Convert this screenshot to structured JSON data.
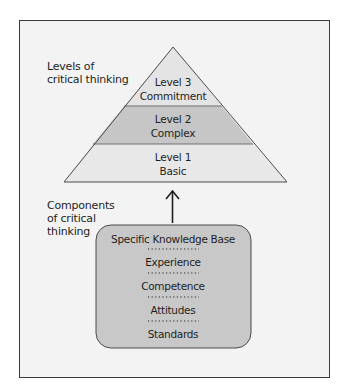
{
  "diagram": {
    "type": "pyramid-with-components",
    "labels": {
      "levels_heading_line1": "Levels of",
      "levels_heading_line2": "critical thinking",
      "components_heading_line1": "Components",
      "components_heading_line2": "of critical",
      "components_heading_line3": "thinking"
    },
    "pyramid": {
      "levels": [
        {
          "line1": "Level 3",
          "line2": "Commitment",
          "color": "#e4e4e4"
        },
        {
          "line1": "Level 2",
          "line2": "Complex",
          "color": "#c6c6c6"
        },
        {
          "line1": "Level 1",
          "line2": "Basic",
          "color": "#e8e8e8"
        }
      ]
    },
    "arrow": {
      "direction": "up",
      "icon": "arrow-up-icon"
    },
    "components_box": {
      "color": "#c8c8c8",
      "items": [
        "Specific Knowledge Base",
        "Experience",
        "Competence",
        "Attitudes",
        "Standards"
      ]
    },
    "colors": {
      "background": "#f3f3f3",
      "border": "#3a3a3a",
      "outline": "#4a4a4a"
    }
  }
}
